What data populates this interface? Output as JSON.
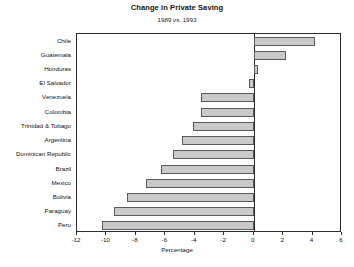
{
  "chart_data": {
    "type": "bar",
    "orientation": "horizontal",
    "title": "Change in Private Saving",
    "subtitle": "1989 vs. 1993",
    "xlabel": "Percentage",
    "ylabel": "",
    "xlim": [
      -12,
      6
    ],
    "xticks": [
      -12,
      -10,
      -8,
      -6,
      -4,
      -2,
      0,
      2,
      4,
      6
    ],
    "xticklabels": [
      "-12",
      "-10",
      "-8",
      "-6",
      "-4",
      "-2",
      "0",
      "2",
      "4",
      "6"
    ],
    "grid": false,
    "legend": false,
    "categories": [
      "Chile",
      "Guatemala",
      "Honduras",
      "El Salvador",
      "Venezuela",
      "Colombia",
      "Trinidad & Tobago",
      "Argentina",
      "Dominican Republic",
      "Brazil",
      "Mexico",
      "Bolivia",
      "Paraguay",
      "Peru"
    ],
    "values": [
      4.2,
      2.2,
      0.3,
      -0.3,
      -3.6,
      -3.6,
      -4.1,
      -4.9,
      -5.5,
      -6.3,
      -7.3,
      -8.6,
      -9.5,
      -10.3
    ],
    "bar_fill_color": "#c9c9c9",
    "bar_edge_color": "#5a5a5a",
    "axis_color": "#2b2b2b"
  }
}
